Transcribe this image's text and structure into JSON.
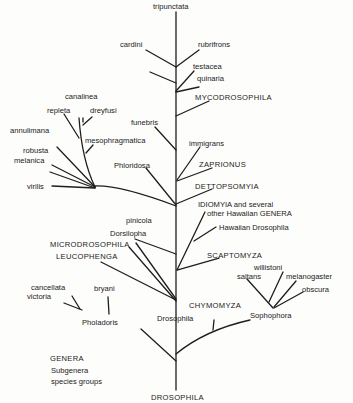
{
  "diagram": {
    "title": "DROSOPHILA",
    "legend": {
      "genera": "GENERA",
      "subgenera": "Subgenera",
      "species_groups": "species groups"
    },
    "labels": {
      "tripunctata": "tripunctata",
      "cardini": "cardini",
      "rubrifrons": "rubrifrons",
      "calloptera": "callopterа",
      "testacea": "testacea",
      "quinaria": "quinaria",
      "mycodrosophila": "MYCODROSOPHILA",
      "canalinea": "canalinea",
      "repleta": "repleta",
      "dreyfusi": "dreyfusi",
      "annulimana": "annulimana",
      "mesophragmatica": "mesophragmatica",
      "funebris": "funebris",
      "immigrans": "immigrans",
      "robusta": "robusta",
      "melanica": "melanica",
      "zaprionus": "ZAPRIONUS",
      "virilis": "virilis",
      "phloridosa": "Phloridosa",
      "dettopsomyia": "DETTOPSOMYIA",
      "idiomyia": "IDIOMYIA and several",
      "other_hawaiian": "other Hawaiian GENERA",
      "hawaiian_drosophila": "Hawaiian Drosophila",
      "pinicola": "pinicola",
      "dorsilopha": "Dorsilopha",
      "microdrosophila": "MICRODROSOPHILA",
      "leucophenga": "LEUCOPHENGA",
      "scaptomyza": "SCAPTOMYZA",
      "willistoni": "willistoni",
      "saltans": "saltans",
      "melanogaster": "melanogaster",
      "obscura": "obscura",
      "cancellata": "cancellata",
      "victoria": "victoria",
      "bryani": "bryani",
      "chymomyza": "CHYMOMYZA",
      "phloadoris": "Pholadoris",
      "drosophila_sub": "Drosophila",
      "sophophora": "Sophophora"
    },
    "colors": {
      "line": "#1e1e1e",
      "text": "#222222",
      "background": "#fdfdfc"
    }
  }
}
